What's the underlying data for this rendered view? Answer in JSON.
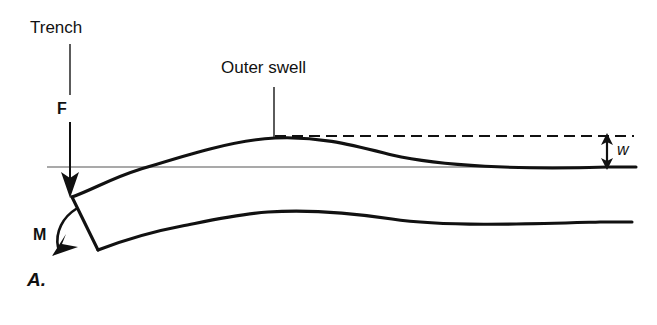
{
  "figure": {
    "panel_label": "A.",
    "labels": {
      "trench": "Trench",
      "outer_swell": "Outer swell",
      "force": "F",
      "moment": "M",
      "deflection": "w"
    },
    "colors": {
      "ink": "#111111",
      "thin_line": "#555555",
      "background": "#ffffff"
    },
    "icon_names": {
      "force_arrow": "down-arrow-icon",
      "moment_arrow": "curved-moment-arrow-icon",
      "deflection_arrow": "double-headed-arrow-icon",
      "dashed_datum": "dashed-reference-line-icon",
      "leader_line": "leader-line-icon"
    },
    "geometry": {
      "reference_line_y": 167,
      "swell_crest_x": 275,
      "swell_crest_y": 138,
      "swell_amplitude_px": 29,
      "plate_top_tip": [
        72,
        197
      ],
      "plate_bottom_tip": [
        98,
        250
      ],
      "dashed_line_y": 136,
      "deflection_arrow_x": 607
    }
  }
}
